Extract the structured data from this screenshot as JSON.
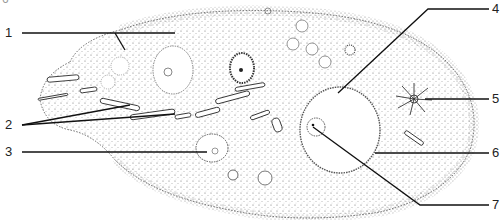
{
  "figure": {
    "corner_mark": "6",
    "labels": [
      {
        "id": "1",
        "text": "1",
        "side": "left",
        "y": 33,
        "target": [
          118,
          16
        ]
      },
      {
        "id": "2",
        "text": "2",
        "side": "left",
        "y": 125,
        "target": [
          175,
          114
        ],
        "target2": [
          132,
          104
        ]
      },
      {
        "id": "3",
        "text": "3",
        "side": "left",
        "y": 152,
        "target": [
          207,
          152
        ]
      },
      {
        "id": "4",
        "text": "4",
        "side": "right",
        "y": 9,
        "target": [
          338,
          93
        ]
      },
      {
        "id": "5",
        "text": "5",
        "side": "right",
        "y": 99,
        "target": [
          425,
          99
        ]
      },
      {
        "id": "6",
        "text": "6",
        "side": "right",
        "y": 153,
        "target": [
          375,
          153
        ]
      },
      {
        "id": "7",
        "text": "7",
        "side": "right",
        "y": 205,
        "target": [
          312,
          131
        ]
      }
    ]
  }
}
